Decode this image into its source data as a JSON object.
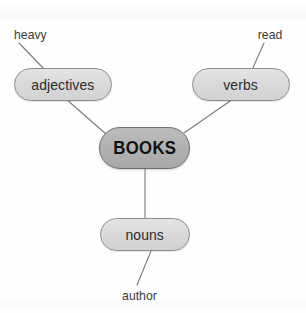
{
  "diagram": {
    "background_color": "#fefefe",
    "central_node": {
      "id": "books",
      "label": "BOOKS",
      "fill_color": "#b2b2b2",
      "stroke_color": "#6f6f6f",
      "text_color": "#111111",
      "shape": "rounded-rectangle",
      "x": 99,
      "y": 127,
      "width": 91,
      "height": 42
    },
    "branch_nodes": [
      {
        "id": "adjectives",
        "label": "adjectives",
        "fill_color": "#dadada",
        "stroke_color": "#8d8d8d",
        "text_color": "#2b2b2b",
        "shape": "rounded-rectangle",
        "x": 14,
        "y": 68,
        "width": 98,
        "height": 33
      },
      {
        "id": "verbs",
        "label": "verbs",
        "fill_color": "#dadada",
        "stroke_color": "#8d8d8d",
        "text_color": "#2b2b2b",
        "shape": "rounded-rectangle",
        "x": 192,
        "y": 68,
        "width": 98,
        "height": 33
      },
      {
        "id": "nouns",
        "label": "nouns",
        "fill_color": "#dadada",
        "stroke_color": "#8d8d8d",
        "text_color": "#2b2b2b",
        "shape": "rounded-rectangle",
        "x": 100,
        "y": 218,
        "width": 90,
        "height": 33
      }
    ],
    "leaf_labels": [
      {
        "id": "heavy",
        "label": "heavy",
        "text_color": "#3a3a3a",
        "x": 13,
        "y": 27
      },
      {
        "id": "read",
        "label": "read",
        "text_color": "#3a3a3a",
        "x": 257,
        "y": 27
      },
      {
        "id": "author",
        "label": "author",
        "text_color": "#3a3a3a",
        "x": 121,
        "y": 288
      }
    ],
    "edges": [
      {
        "id": "adjectives-books",
        "from": "adjectives",
        "to": "books",
        "x1": 66,
        "y1": 99,
        "x2": 106,
        "y2": 134
      },
      {
        "id": "verbs-books",
        "from": "verbs",
        "to": "books",
        "x1": 233,
        "y1": 99,
        "x2": 184,
        "y2": 133
      },
      {
        "id": "books-nouns",
        "from": "books",
        "to": "nouns",
        "x1": 145,
        "y1": 169,
        "x2": 145,
        "y2": 218
      },
      {
        "id": "heavy-adjectives",
        "from": "heavy",
        "to": "adjectives",
        "x1": 19,
        "y1": 43,
        "x2": 45,
        "y2": 70
      },
      {
        "id": "read-verbs",
        "from": "read",
        "to": "verbs",
        "x1": 264,
        "y1": 43,
        "x2": 252,
        "y2": 70
      },
      {
        "id": "nouns-author",
        "from": "nouns",
        "to": "author",
        "x1": 151,
        "y1": 251,
        "x2": 137,
        "y2": 285
      }
    ],
    "edge_style": {
      "stroke_color": "#7a7a7a",
      "stroke_width": 1.1
    }
  }
}
